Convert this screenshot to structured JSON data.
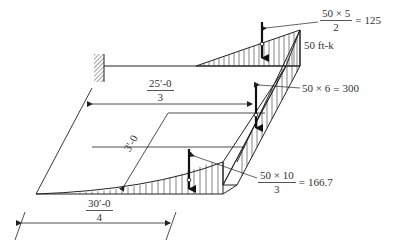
{
  "diagram": {
    "type": "structural moment diagram (isometric frame)",
    "colors": {
      "line": "#222222",
      "text": "#333333",
      "background": "#ffffff"
    },
    "labels": {
      "top_moment": {
        "num": "50 × 5",
        "den": "2",
        "eq": "=",
        "result": "125"
      },
      "tip_moment": "50 ft-k",
      "mid_moment": {
        "expr": "50 × 6",
        "eq": "=",
        "result": "300"
      },
      "bottom_moment": {
        "num": "50 × 10",
        "den": "3",
        "eq": "=",
        "result": "166.7"
      },
      "dim_top": {
        "num": "25′-0",
        "den": "3"
      },
      "dim_diag": "3′-0",
      "dim_bottom": {
        "num": "30′-0",
        "den": "4"
      }
    },
    "elements": [
      {
        "name": "fixed-support",
        "icon": "wall-hatch"
      },
      {
        "name": "top-member"
      },
      {
        "name": "sloped-member"
      },
      {
        "name": "bottom-member"
      },
      {
        "name": "resultant-force-arrows",
        "count": 3
      }
    ]
  }
}
